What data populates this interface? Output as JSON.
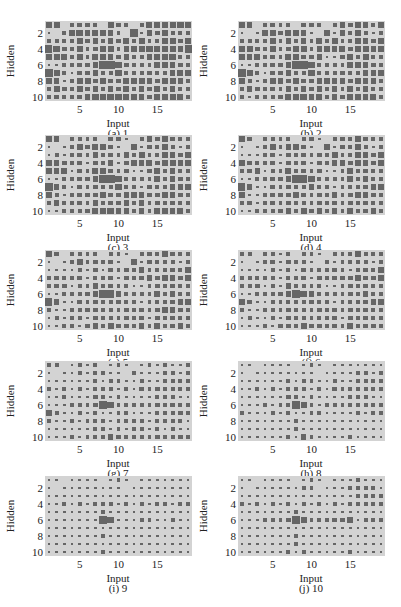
{
  "chart_data": {
    "type": "heatmap",
    "subtype": "hinton",
    "xlabel": "Input",
    "ylabel": "Hidden",
    "x_ticks": [
      5,
      10,
      15
    ],
    "y_ticks": [
      2,
      4,
      6,
      8,
      10
    ],
    "n_rows": 10,
    "n_cols": 19,
    "value_encoding": "each string is one Hidden row (1-10); each digit is the relative square size (0-9) for Input 1-19",
    "colors": {
      "background": "#d3d3d3",
      "square": "#666666"
    },
    "panels": [
      {
        "caption": "(a) 1",
        "rows": [
          "6502332053202546565",
          "1024645642071435223",
          "2222434243535225536",
          "7633423452455646547",
          "4552425543422454623",
          "1123334996332254433",
          "8521334325232322454",
          "5412453533545436543",
          "3533434343534343423",
          "2323346465544345553"
        ]
      },
      {
        "caption": "(b) 2",
        "rows": [
          "5402322033202435424",
          "1014535541061425213",
          "2222424242525225435",
          "6533423452444536546",
          "4452325533411343522",
          "1122334986232244433",
          "8521334225232322444",
          "5212443533444435443",
          "3433324343434243423",
          "2123235464534344452"
        ]
      },
      {
        "caption": "(c) 3",
        "rows": [
          "5402222033102435323",
          "1013535431051324213",
          "1212324232425224435",
          "5433313341344536545",
          "4451325432311343422",
          "1122334885232243433",
          "8421323225231322444",
          "4212333433444335433",
          "2423324333434233323",
          "1123235464434244452"
        ]
      },
      {
        "caption": "(d) 4",
        "rows": [
          "4302222023102325323",
          "1013424431041324213",
          "1112313232325224435",
          "4322313331334435434",
          "3341225332311243322",
          "1122334775232243423",
          "7411323224231222344",
          "4112333432334235433",
          "2312323322323232323",
          "1123234353434243342"
        ]
      },
      {
        "caption": "(e) 5",
        "rows": [
          "4302222022102325322",
          "1012423331041323213",
          "1111213132324223324",
          "3322312231323434434",
          "3331224332211233322",
          "1122234774232243423",
          "7411323223231222344",
          "3112233322333234432",
          "1212213322323132322",
          "1123134353334243342"
        ]
      },
      {
        "caption": "(f) 6",
        "rows": [
          "3202212022102224222",
          "1012313321031223212",
          "1111212132223213324",
          "3222212231323334334",
          "2231214322211233322",
          "1122234764232233423",
          "6311222223221222344",
          "3112223322333233322",
          "1211213222223132322",
          "1113133353333243332"
        ]
      },
      {
        "caption": "(g) 7",
        "rows": [
          "2201212012101213112",
          "1011212211021112212",
          "1111112122112112223",
          "2121212221213233223",
          "1121113212111122211",
          "1112223762232232322",
          "5211212112211122232",
          "2112122212222122221",
          "1111112212122121211",
          "1112122243222232232"
        ]
      },
      {
        "caption": "(h) 8",
        "rows": [
          "1101111012101111111",
          "1011111111011112212",
          "1111112122112112223",
          "1121212221213223223",
          "1111113212111122211",
          "1112122752122222222",
          "2111212112211112122",
          "1111111211111111111",
          "1111111211111111111",
          "1111112142111121111"
        ]
      },
      {
        "caption": "(i) 9",
        "rows": [
          "1101111012101111111",
          "1011111111011111111",
          "1111111111111111111",
          "1121212221212122122",
          "1111111211111111111",
          "1111111761112211211",
          "1111111111111111111",
          "1111111211111111111",
          "1111111111111111111",
          "1111111211111111111"
        ]
      },
      {
        "caption": "(j) 10",
        "rows": [
          "1101111012101112111",
          "1011111122011122221",
          "1111111111111112223",
          "2121212121212123223",
          "1111111211111111111",
          "1112223752233341222",
          "1111111111111111111",
          "1111111211111111111",
          "1111111211111111111",
          "1111112121111121111"
        ]
      }
    ]
  }
}
